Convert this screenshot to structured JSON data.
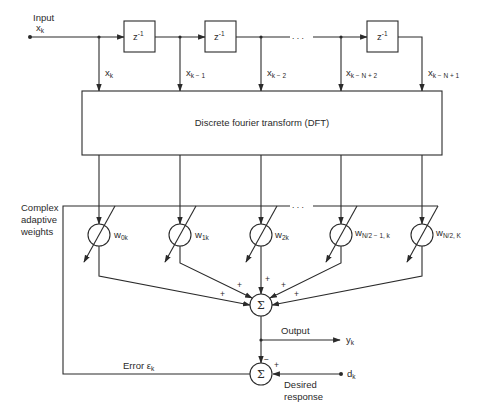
{
  "diagram": {
    "input": {
      "label": "Input",
      "signal": "x",
      "signal_sub": "k"
    },
    "delays": [
      {
        "label": "z",
        "sup": "-1"
      },
      {
        "label": "z",
        "sup": "-1"
      },
      {
        "label": "z",
        "sup": "-1"
      }
    ],
    "ellipsis": ". . .",
    "taps": [
      {
        "signal": "x",
        "sub": "k"
      },
      {
        "signal": "x",
        "sub": "k − 1"
      },
      {
        "signal": "x",
        "sub": "k − 2"
      },
      {
        "signal": "x",
        "sub": "k − N + 2"
      },
      {
        "signal": "x",
        "sub": "k − N + 1"
      }
    ],
    "dft": {
      "label": "Discrete fourier transform (DFT)"
    },
    "weights_group_label": [
      "Complex",
      "adaptive",
      "weights"
    ],
    "weights": [
      {
        "symbol": "w",
        "sub": "0k"
      },
      {
        "symbol": "w",
        "sub": "1k"
      },
      {
        "symbol": "w",
        "sub": "2k"
      },
      {
        "symbol": "w",
        "sub": "N/2 − 1, k"
      },
      {
        "symbol": "w",
        "sub": "N/2, K"
      }
    ],
    "summer": {
      "symbol": "Σ",
      "input_signs": [
        "+",
        "+",
        "+",
        "+",
        "+"
      ]
    },
    "output": {
      "label": "Output",
      "signal": "y",
      "signal_sub": "k"
    },
    "error_summer": {
      "symbol": "Σ",
      "minus_sign": "−",
      "plus_sign": "+"
    },
    "error": {
      "label": "Error ε",
      "sub": "k"
    },
    "desired": {
      "label_line1": "Desired",
      "label_line2": "response",
      "signal": "d",
      "signal_sub": "k"
    }
  }
}
